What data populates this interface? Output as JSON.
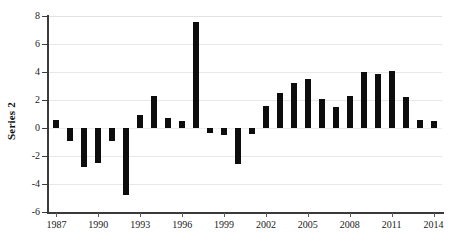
{
  "chart_data": {
    "type": "bar",
    "title": "",
    "subtitle": "",
    "xlabel": "",
    "ylabel": "Series 2",
    "legend": [],
    "legend_position": "none",
    "grid": true,
    "grid_axis": "y",
    "bar_color": "#0d0d0d",
    "background_color": "#ffffff",
    "axis_color": "#3a3a3a",
    "gridline_color": "#e8e8e8",
    "xlim": [
      1986.4,
      2014.6
    ],
    "ylim": [
      -6,
      8
    ],
    "ytick_values": [
      8,
      6,
      4,
      2,
      0,
      -2,
      -4,
      -6
    ],
    "ytick_labels": [
      "8",
      "6",
      "4",
      "2",
      "0",
      "-2",
      "-4",
      "-6"
    ],
    "xtick_values": [
      1987,
      1990,
      1993,
      1996,
      1999,
      2002,
      2005,
      2008,
      2011,
      2014
    ],
    "xtick_labels": [
      "1987",
      "1990",
      "1993",
      "1996",
      "1999",
      "2002",
      "2005",
      "2008",
      "2011",
      "2014"
    ],
    "categories": [
      1987,
      1988,
      1989,
      1990,
      1991,
      1992,
      1993,
      1994,
      1995,
      1996,
      1997,
      1998,
      1999,
      2000,
      2001,
      2002,
      2003,
      2004,
      2005,
      2006,
      2007,
      2008,
      2009,
      2010,
      2011,
      2012,
      2013,
      2014
    ],
    "values": [
      0.6,
      -0.9,
      -2.8,
      -2.5,
      -0.9,
      -4.8,
      0.9,
      2.3,
      0.7,
      0.5,
      7.6,
      -0.35,
      -0.5,
      -2.6,
      -0.4,
      1.6,
      2.5,
      3.2,
      3.5,
      2.1,
      1.5,
      2.3,
      4.0,
      3.85,
      4.1,
      2.2,
      0.6,
      0.5
    ]
  }
}
